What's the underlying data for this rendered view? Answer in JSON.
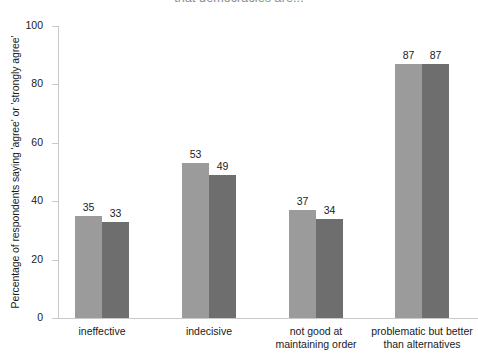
{
  "chart_data": {
    "type": "bar",
    "title": "that democracies are...",
    "title_note": "first line of title is cropped above the top edge of the screenshot",
    "xlabel": "",
    "ylabel": "Percentage of respondents saying 'agree' or 'strongly agree'",
    "categories": [
      "ineffective",
      "indecisive",
      "not good at\nmaintaining order",
      "problematic but better\nthan alternatives"
    ],
    "series": [
      {
        "name": "series-a",
        "color": "#9b9b9b",
        "values": [
          35,
          53,
          37,
          87
        ]
      },
      {
        "name": "series-b",
        "color": "#6e6e6e",
        "values": [
          33,
          49,
          34,
          87
        ]
      }
    ],
    "ylim": [
      0,
      100
    ],
    "yticks": [
      0,
      20,
      40,
      60,
      80,
      100
    ],
    "ytick_labels": [
      "0",
      "20",
      "40",
      "60",
      "80",
      "100"
    ],
    "grid": false,
    "legend": "none",
    "data_labels": true
  }
}
